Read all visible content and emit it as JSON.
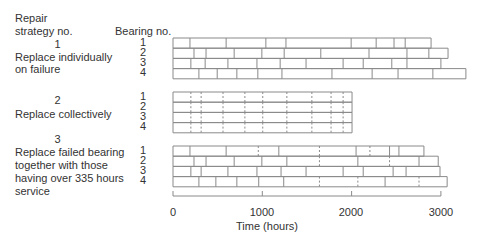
{
  "headers": {
    "strategy": [
      "Repair",
      "strategy no."
    ],
    "bearing": "Bearing no."
  },
  "strategies": [
    {
      "number": "1",
      "label_lines": [
        "Replace individually",
        "on failure"
      ]
    },
    {
      "number": "2",
      "label_lines": [
        "Replace collectively"
      ]
    },
    {
      "number": "3",
      "label_lines": [
        "Replace failed bearing",
        "together with those",
        "having over 335 hours",
        "service"
      ]
    }
  ],
  "bearing_numbers": [
    "1",
    "2",
    "3",
    "4"
  ],
  "axis": {
    "label": "Time (hours)",
    "ticks": [
      "0",
      "1000",
      "2000",
      "3000"
    ]
  },
  "chart_data": {
    "type": "timeline",
    "title": "",
    "xlabel": "Time (hours)",
    "xlim": [
      0,
      3000
    ],
    "x_ticks": [
      0,
      1000,
      2000,
      3000
    ],
    "strategies": [
      {
        "name": "1 Replace individually on failure",
        "bearings": [
          {
            "bearing": 1,
            "replacements": [
              190,
              595,
              1040,
              1265,
              1995,
              2275,
              2475,
              2600
            ],
            "end": 2890
          },
          {
            "bearing": 2,
            "replacements": [
              235,
              370,
              685,
              995,
              1245,
              1655,
              2195,
              2620,
              2865
            ],
            "end": 3080
          },
          {
            "bearing": 3,
            "replacements": [
              200,
              360,
              615,
              940,
              1200,
              1490,
              1905,
              2130,
              2450,
              2620
            ],
            "end": 3000
          },
          {
            "bearing": 4,
            "replacements": [
              290,
              495,
              715,
              950,
              1220,
              1780,
              2230,
              2520,
              2910
            ],
            "end": 3280
          }
        ]
      },
      {
        "name": "2 Replace collectively",
        "collective_replacements": [
          200,
          315,
          560,
          805,
          1005,
          1275,
          1555,
          1770,
          1905
        ],
        "bearings": [
          {
            "bearing": 1,
            "end": 2005
          },
          {
            "bearing": 2,
            "end": 2005
          },
          {
            "bearing": 3,
            "end": 2005
          },
          {
            "bearing": 4,
            "end": 2005
          }
        ]
      },
      {
        "name": "3 Replace failed bearing together with those having over 335 hours service",
        "bearings": [
          {
            "bearing": 1,
            "failures": [
              190,
              595,
              1185,
              2050,
              2425,
              2530
            ],
            "preventive": [
              955,
              1640,
              2205
            ],
            "end": 2810
          },
          {
            "bearing": 2,
            "failures": [
              235,
              370,
              685,
              995,
              1275,
              2070,
              2755
            ],
            "preventive": [
              1640,
              2425
            ],
            "end": 2970
          },
          {
            "bearing": 3,
            "failures": [
              200,
              315,
              615,
              940,
              1210,
              1490,
              1905,
              2130,
              2465,
              2610
            ],
            "preventive": [],
            "end": 2990
          },
          {
            "bearing": 4,
            "failures": [
              290,
              480,
              715,
              960,
              1240,
              2375
            ],
            "preventive": [
              1640,
              2070,
              2755
            ],
            "end": 3070
          }
        ]
      }
    ]
  }
}
